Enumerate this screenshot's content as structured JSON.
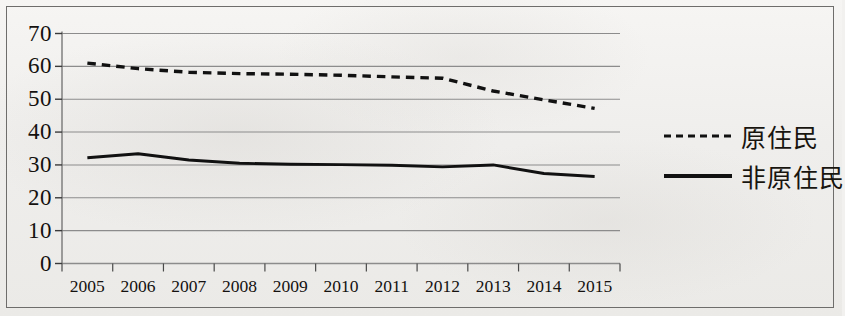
{
  "figure": {
    "background_color": "#f0efed",
    "border_color": "#6e6d6b"
  },
  "legend": {
    "position": "right",
    "entries": [
      {
        "label": "原住民",
        "style": "dashed",
        "color": "#111111"
      },
      {
        "label": "非原住民",
        "style": "solid",
        "color": "#111111"
      }
    ]
  },
  "axis": {
    "y_ticks": [
      "70",
      "60",
      "50",
      "40",
      "30",
      "20",
      "10",
      "0"
    ],
    "x_ticks": [
      "2005",
      "2006",
      "2007",
      "2008",
      "2009",
      "2010",
      "2011",
      "2012",
      "2013",
      "2014",
      "2015"
    ]
  },
  "chart_data": {
    "type": "line",
    "title": "",
    "subtitle": "",
    "xlabel": "",
    "ylabel": "",
    "ylim": [
      0,
      70
    ],
    "ytick_step": 10,
    "grid": true,
    "grid_axis": "y",
    "legend_position": "right",
    "categories": [
      "2005",
      "2006",
      "2007",
      "2008",
      "2009",
      "2010",
      "2011",
      "2012",
      "2013",
      "2014",
      "2015"
    ],
    "series": [
      {
        "name": "原住民",
        "style": "dashed",
        "color": "#111111",
        "values": [
          61.0,
          59.3,
          58.2,
          57.8,
          57.6,
          57.3,
          56.8,
          56.4,
          52.5,
          49.8,
          47.2
        ]
      },
      {
        "name": "非原住民",
        "style": "solid",
        "color": "#111111",
        "values": [
          32.2,
          33.4,
          31.5,
          30.5,
          30.2,
          30.1,
          29.9,
          29.4,
          30.0,
          27.4,
          26.5
        ]
      }
    ]
  }
}
